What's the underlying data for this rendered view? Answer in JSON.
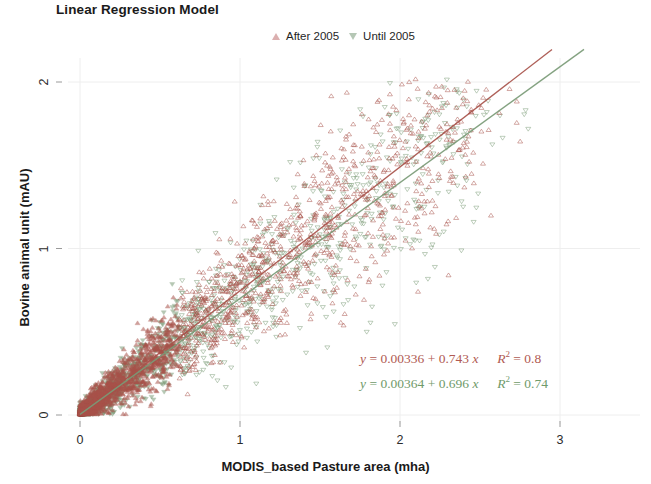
{
  "chart_data": {
    "type": "scatter",
    "title": "Linear Regression Model",
    "xlabel": "MODIS_based Pasture area (mha)",
    "ylabel": "Bovine animal unit (mAU)",
    "xlim": [
      -0.08,
      3.1
    ],
    "ylim": [
      -0.08,
      2.15
    ],
    "xticks": [
      0,
      1,
      2,
      3
    ],
    "xtick_labels": [
      "0",
      "1",
      "2",
      "3"
    ],
    "yticks": [
      0,
      1,
      2
    ],
    "ytick_labels": [
      "0",
      "1",
      "2"
    ],
    "grid": true,
    "grid_color": "#eeeeee",
    "legend_position": "top-center",
    "background": "#ffffff",
    "series": [
      {
        "name": "After 2005",
        "marker": "triangle-up",
        "color": "#a8524a",
        "point_count": 2400,
        "fit": {
          "intercept": 0.00336,
          "slope": 0.743,
          "r_squared": 0.8,
          "line_color": "#a8524a",
          "x_range": [
            0,
            2.95
          ]
        }
      },
      {
        "name": "Until 2005",
        "marker": "triangle-down",
        "color": "#7a9b77",
        "point_count": 1600,
        "fit": {
          "intercept": 0.00364,
          "slope": 0.696,
          "r_squared": 0.74,
          "line_color": "#7a9b77",
          "x_range": [
            0,
            3.15
          ]
        }
      }
    ],
    "annotations": [
      {
        "id": "eq-after-2005",
        "color": "#b05a52",
        "text": "y = 0.00336 + 0.743 x   R² = 0.8",
        "y_label": "y",
        "equals": "=",
        "intercept": "0.00336",
        "plus": "+",
        "slope": "0.743",
        "x_var": "x",
        "r2_label": "R",
        "r2_exp": "2",
        "r2_value": "0.8"
      },
      {
        "id": "eq-until-2005",
        "color": "#6f9a6a",
        "text": "y = 0.00364 + 0.696 x   R² = 0.74",
        "y_label": "y",
        "equals": "=",
        "intercept": "0.00364",
        "plus": "+",
        "slope": "0.696",
        "x_var": "x",
        "r2_label": "R",
        "r2_exp": "2",
        "r2_value": "0.74"
      }
    ]
  },
  "legend": {
    "items": [
      {
        "label": "After 2005",
        "marker": "triangle-up-icon"
      },
      {
        "label": "Until 2005",
        "marker": "triangle-down-icon"
      }
    ]
  },
  "axes": {
    "x": {
      "label": "MODIS_based Pasture area (mha)",
      "ticks": [
        "0",
        "1",
        "2",
        "3"
      ]
    },
    "y": {
      "label": "Bovine animal unit (mAU)",
      "ticks": [
        "0",
        "1",
        "2"
      ]
    }
  },
  "title": "Linear Regression Model"
}
